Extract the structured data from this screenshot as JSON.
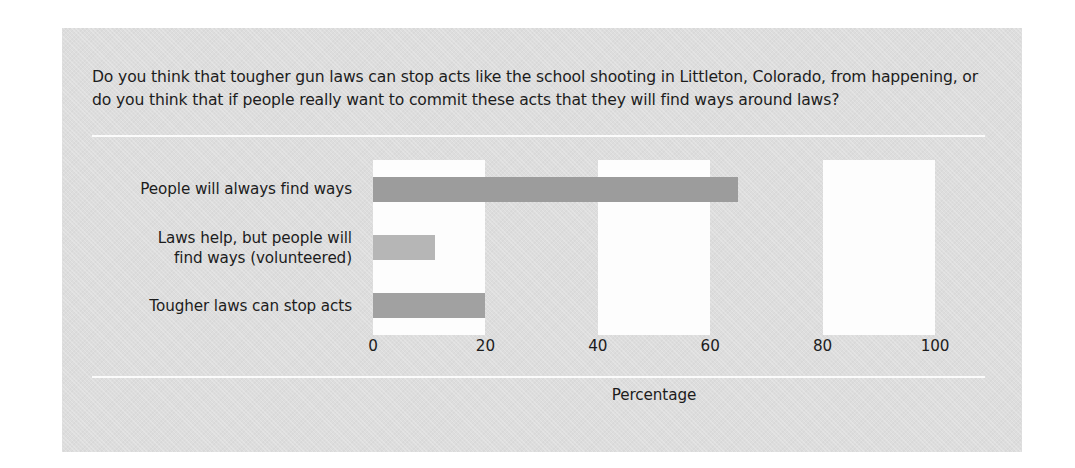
{
  "figure": {
    "panel_color": "#dddddd",
    "rule_color": "#fbfbfb",
    "band_light_color": "#fdfdfd"
  },
  "question": "Do you think that tougher gun laws can stop acts like the school shooting in Littleton, Colorado, from happening, or do you think that if people really want to commit these acts that they will find ways around laws?",
  "chart_data": {
    "type": "bar",
    "orientation": "horizontal",
    "title": "",
    "subtitle": "",
    "xlabel": "Percentage",
    "ylabel": "",
    "xlim": [
      0,
      100
    ],
    "xticks": [
      0,
      20,
      40,
      60,
      80,
      100
    ],
    "xticklabels": [
      "0",
      "20",
      "40",
      "60",
      "80",
      "100"
    ],
    "grid": false,
    "banded_background": true,
    "legend": "none",
    "categories": [
      "People will always find ways",
      "Laws help, but people will\nfind ways (volunteered)",
      "Tougher laws can stop acts"
    ],
    "values": [
      65,
      11,
      20
    ],
    "bar_colors": [
      "#9c9c9c",
      "#b6b6b6",
      "#a1a1a1"
    ]
  }
}
